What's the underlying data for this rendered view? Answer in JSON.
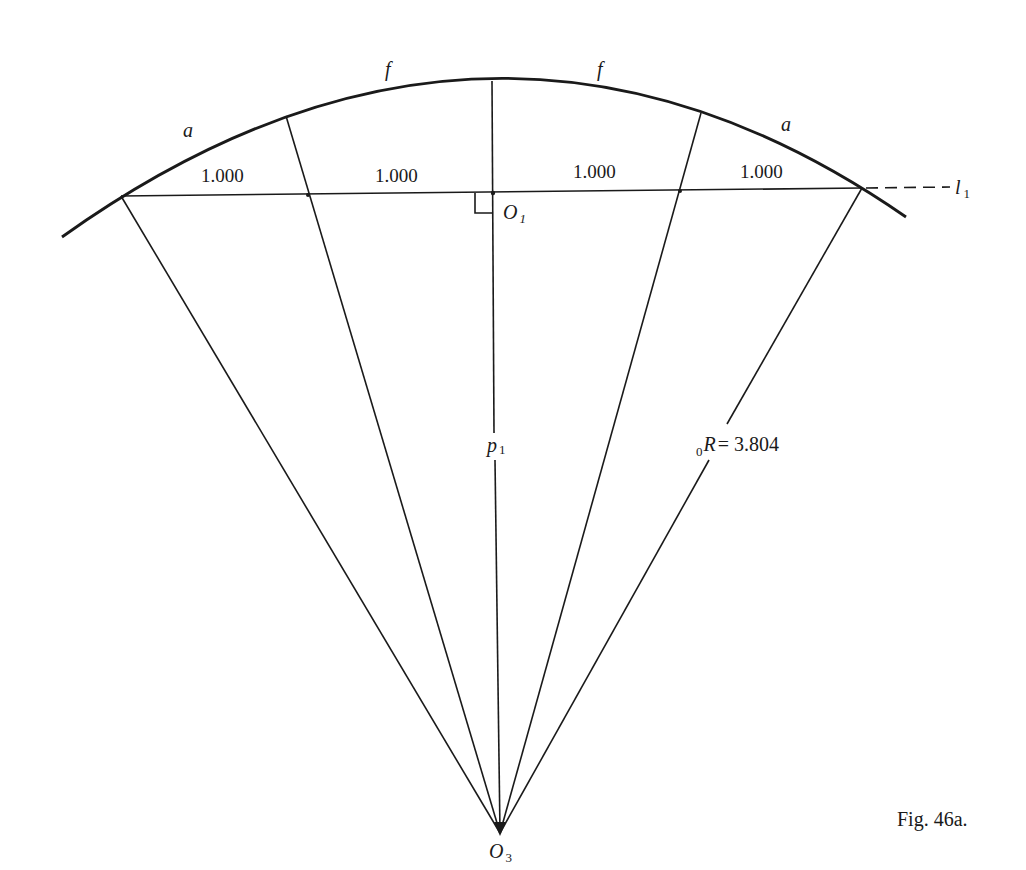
{
  "figure": {
    "caption": "Fig. 46a.",
    "arc_labels": {
      "left_outer": "a",
      "left_inner": "f",
      "right_inner": "f",
      "right_outer": "a"
    },
    "segment_labels": [
      "1.000",
      "1.000",
      "1.000",
      "1.000"
    ],
    "points": {
      "o1": {
        "letter": "O",
        "sub": "1"
      },
      "o3": {
        "letter": "O",
        "sub": "3"
      }
    },
    "line_labels": {
      "l1": {
        "letter": "l",
        "sub": "1"
      },
      "p1": {
        "letter": "p",
        "sub": "1"
      },
      "radius": {
        "pre_sub": "0",
        "letter": "R",
        "value": "= 3.804"
      }
    }
  }
}
